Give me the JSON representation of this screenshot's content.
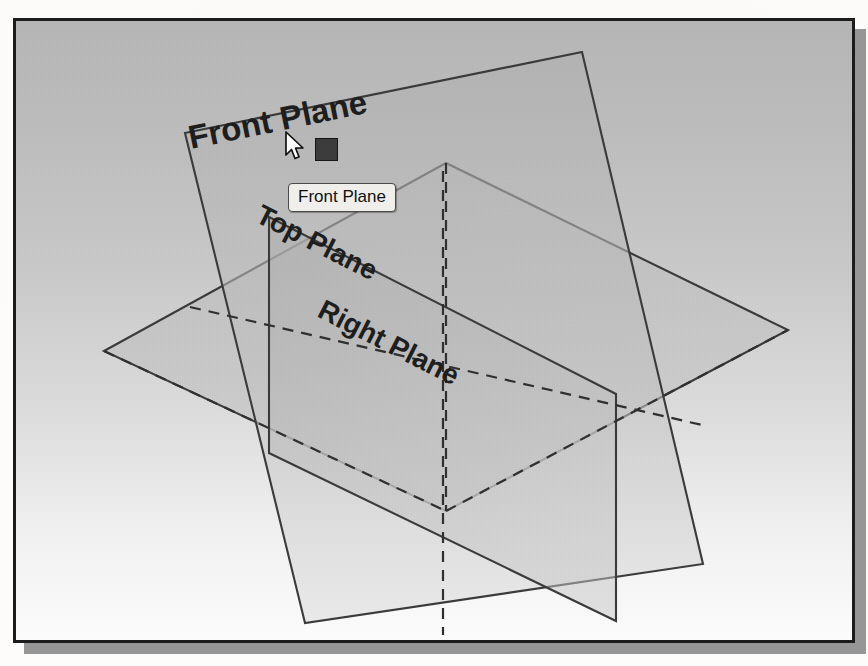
{
  "document": {
    "type": "scanned-textbook-figure",
    "subject": "CAD reference planes isometric view"
  },
  "bleed_through": {
    "line1": "s on the Document Properties",
    "line2": "ne drawing standard ANSI as the",
    "line3": "dimension",
    "line4": "shown in Figure",
    "line5": "below",
    "line6": "on the"
  },
  "viewport": {
    "background_top_color": "#b6b6b6",
    "background_bottom_color": "#fdfdfd",
    "border_color": "#1c1c1c",
    "shadow_color": "#8d8d8d"
  },
  "planes": [
    {
      "id": "front-plane",
      "label": "Front Plane",
      "state": "selected",
      "fill": "#b3b3b3",
      "stroke": "#3a3a3a",
      "label_rotation_deg": 9,
      "label_x": 190,
      "label_y": 110
    },
    {
      "id": "top-plane",
      "label": "Top Plane",
      "state": "normal",
      "fill": "#b8b8b8",
      "stroke": "#3a3a3a",
      "label_rotation_deg": 33,
      "label_x": 245,
      "label_y": 172
    },
    {
      "id": "right-plane",
      "label": "Right Plane",
      "state": "normal",
      "fill": "#b0b0b0",
      "stroke": "#3a3a3a",
      "label_rotation_deg": -33,
      "label_x": 305,
      "label_y": 262
    }
  ],
  "tooltip": {
    "text": "Front Plane",
    "background": "#f2f0ec",
    "border_color": "#4a4a4a"
  },
  "selection_handle": {
    "name": "plane-corner-handle",
    "color": "#3b3b3b"
  },
  "cursor": {
    "name": "arrow-cursor",
    "fill": "#ffffff",
    "stroke": "#101010"
  }
}
